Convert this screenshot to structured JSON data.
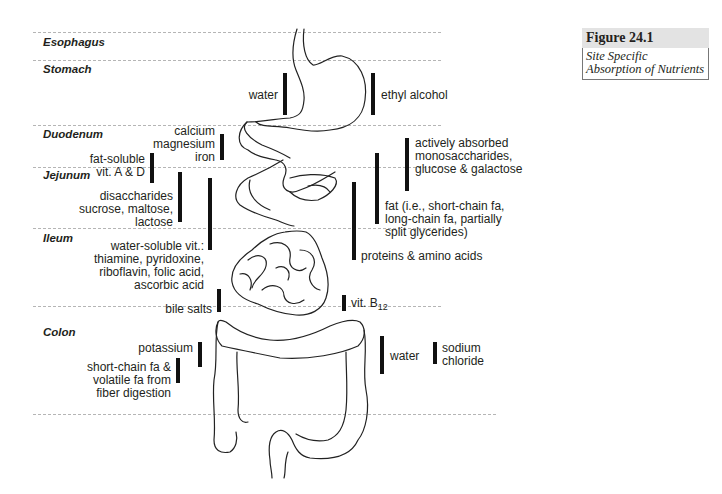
{
  "figure": {
    "number": "Figure 24.1",
    "caption": "Site Specific Absorption of Nutrients"
  },
  "segments": [
    {
      "id": "esophagus",
      "label": "Esophagus"
    },
    {
      "id": "stomach",
      "label": "Stomach"
    },
    {
      "id": "duodenum",
      "label": "Duodenum"
    },
    {
      "id": "jejunum",
      "label": "Jejunum"
    },
    {
      "id": "ileum",
      "label": "Ileum"
    },
    {
      "id": "colon",
      "label": "Colon"
    }
  ],
  "nutrients": {
    "stomach_water": "water",
    "ethyl_alcohol": "ethyl alcohol",
    "calcium_magnesium_iron": "calcium\nmagnesium\niron",
    "fat_soluble_vitamins": "fat-soluble\nvit. A & D",
    "disaccharides": "disaccharides\nsucrose, maltose,\nlactose",
    "water_soluble_vitamins": "water-soluble vit.:\nthiamine, pyridoxine,\nriboflavin, folic acid,\nascorbic acid",
    "bile_salts": "bile salts",
    "monosaccharides": "actively absorbed\nmonosaccharides,\nglucose & galactose",
    "fat": "fat (i.e., short-chain fa,\nlong-chain fa, partially\nsplit glycerides)",
    "proteins": "proteins & amino acids",
    "vit_b12_prefix": "vit. B",
    "vit_b12_sub": "12",
    "potassium": "potassium",
    "short_chain_fa": "short-chain fa &\nvolatile fa from\nfiber digestion",
    "colon_water": "water",
    "sodium_chloride": "sodium\nchloride"
  }
}
